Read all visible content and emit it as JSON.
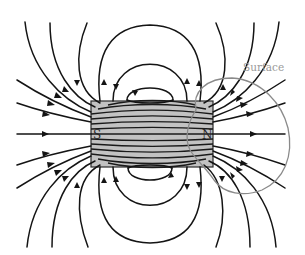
{
  "diagram": {
    "type": "magnetic-field-lines-bar-magnet",
    "magnet": {
      "south_label": "S",
      "north_label": "N",
      "fill_color": "#c2c2c2",
      "outline_color": "#2a2a2a"
    },
    "surface": {
      "label": "Surface",
      "stroke_color": "#8a8a8a",
      "encloses": "N pole"
    },
    "field_lines": {
      "color": "#141414",
      "direction": "exit N pole, enter S pole; inside magnet S to N",
      "top_loops": 3,
      "bottom_loops": 3,
      "axis_line": 1,
      "fan_lines_per_quadrant": 5
    }
  }
}
